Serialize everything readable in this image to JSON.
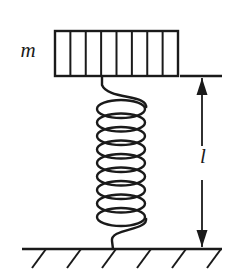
{
  "figure": {
    "background_color": "#ffffff",
    "ink_color": "#1a1a1a",
    "width": 245,
    "height": 280
  },
  "labels": {
    "mass": {
      "text": "m",
      "style": "italic-serif",
      "x": 28,
      "y": 57,
      "font_size": 21,
      "describes": "mass-block"
    },
    "length": {
      "text": "l",
      "style": "italic-serif",
      "x": 203,
      "y": 163,
      "font_size": 21,
      "describes": "spring-length-dimension"
    }
  },
  "mass_block": {
    "name": "hatched-mass-block",
    "x": 55,
    "y": 31,
    "width": 123,
    "height": 45,
    "cell_count": 8,
    "divider_count": 7,
    "outline_width": 2.4,
    "divider_width": 2.0,
    "fill": "#ffffff"
  },
  "spring": {
    "name": "coil-spring",
    "coil_count": 9,
    "coil_center_x": 121,
    "coil_rx": 24,
    "coil_ry": 9,
    "coil_top_y": 109,
    "coil_pitch": 13.5,
    "stroke_width": 2.4,
    "top_attach_x": 102,
    "top_attach_y": 76,
    "bottom_attach_x": 113,
    "bottom_attach_y": 249
  },
  "ground": {
    "name": "ground-line",
    "x1": 22,
    "x2": 222,
    "y": 249,
    "stroke_width": 2.6,
    "hatch_count": 6,
    "hatch_start_x": 46,
    "hatch_spacing": 35,
    "hatch_dx": -14,
    "hatch_dy": 19,
    "hatch_stroke_width": 2.0
  },
  "dimension": {
    "name": "length-dimension-arrow",
    "axis_x": 202,
    "top_y": 78,
    "bottom_y": 247,
    "gap_top_y": 146,
    "gap_bottom_y": 180,
    "stroke_width": 1.8,
    "arrow_half_width": 5.5,
    "arrow_length": 17,
    "reference_line": {
      "name": "top-reference-tick",
      "x1": 180,
      "x2": 222,
      "y": 76,
      "stroke_width": 2.6
    }
  }
}
